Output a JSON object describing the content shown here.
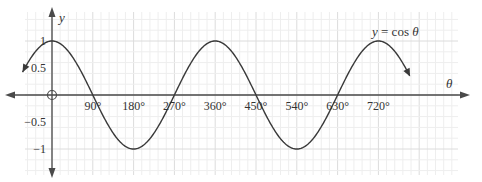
{
  "chart_data": {
    "type": "line",
    "title": "",
    "function_label": "y = cos θ",
    "function_label_parts": {
      "y": "y",
      "eq": " = cos ",
      "theta": "θ"
    },
    "xlabel": "θ",
    "ylabel": "y",
    "x_unit": "degrees",
    "x_ticks": [
      90,
      180,
      270,
      360,
      450,
      540,
      630,
      720
    ],
    "x_tick_labels": [
      "90°",
      "180°",
      "270°",
      "360°",
      "450°",
      "540°",
      "630°",
      "720°"
    ],
    "y_ticks": [
      1,
      0.5,
      -0.5,
      -1
    ],
    "y_tick_labels": [
      "1",
      "0.5",
      "−0.5",
      "−1"
    ],
    "xlim": [
      -65,
      790
    ],
    "ylim": [
      -1,
      1
    ],
    "grid": true,
    "legend": null,
    "series": [
      {
        "name": "y = cos θ",
        "x": [
          -65,
          0,
          90,
          180,
          270,
          360,
          450,
          540,
          630,
          720,
          790
        ],
        "values": [
          0.42,
          1,
          0,
          -1,
          0,
          1,
          0,
          -1,
          0,
          1,
          0.34
        ]
      }
    ],
    "origin_marker": "open-circle"
  },
  "colors": {
    "curve": "#3a3a3a",
    "axis": "#4a4a4a",
    "grid_major": "#dcdcdc",
    "grid_minor": "#eeeeee",
    "text": "#333333"
  }
}
